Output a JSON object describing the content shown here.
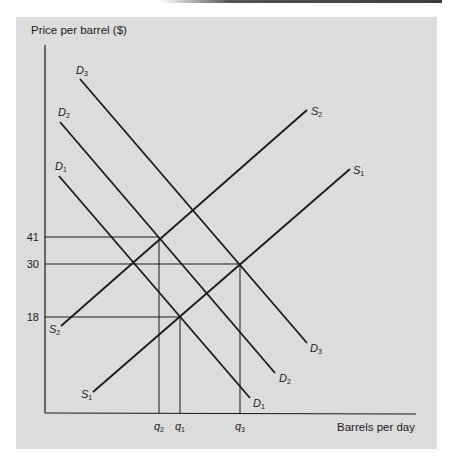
{
  "chart_data": {
    "type": "line",
    "title": "",
    "ylabel": "Price per barrel ($)",
    "xlabel": "Barrels per day",
    "grid": false,
    "legend": "none (curves labeled inline)",
    "y_ticks": [
      {
        "label": "41",
        "value": 41,
        "py": 237,
        "to_x": 159
      },
      {
        "label": "30",
        "value": 30,
        "py": 264,
        "to_x": 240
      },
      {
        "label": "18",
        "value": 18,
        "py": 317,
        "to_x": 180
      }
    ],
    "x_ticks": [
      {
        "label": "q",
        "sub": "2",
        "px": 159,
        "from_y": 237
      },
      {
        "label": "q",
        "sub": "1",
        "px": 180,
        "from_y": 317
      },
      {
        "label": "q",
        "sub": "3",
        "px": 240,
        "from_y": 264
      }
    ],
    "series": [
      {
        "name": "D1",
        "kind": "demand",
        "x1": 59,
        "y1": 176,
        "x2": 250,
        "y2": 398,
        "start_label": {
          "text": "D",
          "sub": "1",
          "x": 55,
          "y": 170
        },
        "end_label": {
          "text": "D",
          "sub": "1",
          "x": 253,
          "y": 407
        }
      },
      {
        "name": "D2",
        "kind": "demand",
        "x1": 60,
        "y1": 122,
        "x2": 275,
        "y2": 373,
        "start_label": {
          "text": "D",
          "sub": "2",
          "x": 58,
          "y": 116
        },
        "end_label": {
          "text": "D",
          "sub": "2",
          "x": 279,
          "y": 382
        }
      },
      {
        "name": "D3",
        "kind": "demand",
        "x1": 80,
        "y1": 79,
        "x2": 307,
        "y2": 343,
        "start_label": {
          "text": "D",
          "sub": "3",
          "x": 76,
          "y": 74
        },
        "end_label": {
          "text": "D",
          "sub": "3",
          "x": 310,
          "y": 352
        }
      },
      {
        "name": "S1",
        "kind": "supply",
        "x1": 93,
        "y1": 392,
        "x2": 350,
        "y2": 169,
        "start_label": {
          "text": "S",
          "sub": "1",
          "x": 81,
          "y": 398
        },
        "end_label": {
          "text": "S",
          "sub": "1",
          "x": 353,
          "y": 174
        }
      },
      {
        "name": "S2",
        "kind": "supply",
        "x1": 61,
        "y1": 326,
        "x2": 307,
        "y2": 110,
        "start_label": {
          "text": "S",
          "sub": "2",
          "x": 49,
          "y": 333
        },
        "end_label": {
          "text": "S",
          "sub": "2",
          "x": 311,
          "y": 115
        }
      }
    ],
    "equilibria": [
      {
        "curves": [
          "D1",
          "S1"
        ],
        "price": 18,
        "quantity": "q1"
      },
      {
        "curves": [
          "D2",
          "S2"
        ],
        "price": 41,
        "quantity": "q2"
      },
      {
        "curves": [
          "D3",
          "S1"
        ],
        "price": 30,
        "quantity": "q3"
      }
    ],
    "axes": {
      "origin_x": 45,
      "origin_y": 413,
      "y_top": 45,
      "x_right": 416
    },
    "colors": {
      "panel": "#dcdcdc",
      "ink": "#1a1a1a"
    }
  }
}
